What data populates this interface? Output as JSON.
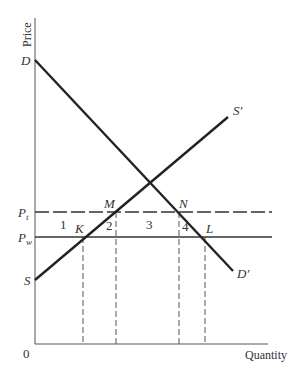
{
  "diagram": {
    "type": "supply-demand-tariff",
    "axes": {
      "y_label": "Price",
      "x_label": "Quantity",
      "origin_label": "0"
    },
    "curves": {
      "demand": {
        "start_label": "D",
        "end_label": "D′"
      },
      "supply": {
        "start_label": "S",
        "end_label": "S′"
      }
    },
    "price_levels": {
      "tariff": {
        "label": "P",
        "sub": "t"
      },
      "world": {
        "label": "P",
        "sub": "w"
      }
    },
    "points": {
      "K": "K",
      "M": "M",
      "N": "N",
      "L": "L"
    },
    "areas": {
      "a1": "1",
      "a2": "2",
      "a3": "3",
      "a4": "4"
    }
  }
}
